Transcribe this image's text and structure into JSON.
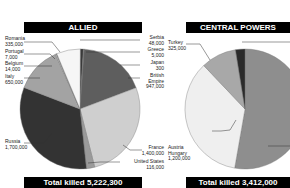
{
  "chart_data": [
    {
      "type": "pie",
      "title": "ALLIED",
      "footer": "Total killed 5,222,300",
      "total": 5222300,
      "slices": [
        {
          "label": "Serbia",
          "value": 48000,
          "color": "#3a3a3a"
        },
        {
          "label": "Greece",
          "value": 5000,
          "color": "#5a5a5a"
        },
        {
          "label": "Japan",
          "value": 300,
          "color": "#888888"
        },
        {
          "label": "British Empire",
          "value": 947000,
          "color": "#5e5e5e"
        },
        {
          "label": "France",
          "value": 1400000,
          "color": "#cfcfcf"
        },
        {
          "label": "United States",
          "value": 116000,
          "color": "#9a9a9a"
        },
        {
          "label": "Russia",
          "value": 1700000,
          "color": "#333333"
        },
        {
          "label": "Italy",
          "value": 650000,
          "color": "#a3a3a3"
        },
        {
          "label": "Belgium",
          "value": 14000,
          "color": "#c8c8c8"
        },
        {
          "label": "Portugal",
          "value": 7000,
          "color": "#7a7a7a"
        },
        {
          "label": "Romania",
          "value": 335000,
          "color": "#f6f6f6"
        }
      ]
    },
    {
      "type": "pie",
      "title": "CENTRAL POWERS",
      "footer": "Total killed 3,412,000",
      "total": 3412000,
      "slices": [
        {
          "label": "Germany",
          "value": 1800000,
          "color": "#8e8e8e"
        },
        {
          "label": "Austria Hungary",
          "value": 1200000,
          "color": "#efefef"
        },
        {
          "label": "Turkey",
          "value": 325000,
          "color": "#a8a8a8"
        },
        {
          "label": "Bulgaria",
          "value": 87000,
          "color": "#2a2a2a"
        }
      ]
    }
  ],
  "allied": {
    "title": "ALLIED",
    "footer": "Total killed 5,222,300",
    "labels": {
      "romania": {
        "name": "Romania",
        "value": "335,000"
      },
      "portugal": {
        "name": "Portugal",
        "value": "7,000"
      },
      "belgium": {
        "name": "Belgium",
        "value": "14,000"
      },
      "italy": {
        "name": "Italy",
        "value": "650,000"
      },
      "russia": {
        "name": "Russia",
        "value": "1,700,000"
      },
      "serbia": {
        "name": "Serbia",
        "value": "48,000"
      },
      "greece": {
        "name": "Greece",
        "value": "5,000"
      },
      "japan": {
        "name": "Japan",
        "value": "300"
      },
      "british": {
        "name1": "British",
        "name2": "Empire",
        "value": "947,000"
      },
      "france": {
        "name": "France",
        "value": "1,400,000"
      },
      "us": {
        "name": "United States",
        "value": "116,000"
      }
    }
  },
  "central": {
    "title": "CENTRAL POWERS",
    "footer": "Total killed 3,412,000",
    "labels": {
      "turkey": {
        "name": "Turkey",
        "value": "325,000"
      },
      "austria": {
        "name1": "Austria",
        "name2": "Hungary",
        "value": "1,200,000"
      }
    }
  }
}
